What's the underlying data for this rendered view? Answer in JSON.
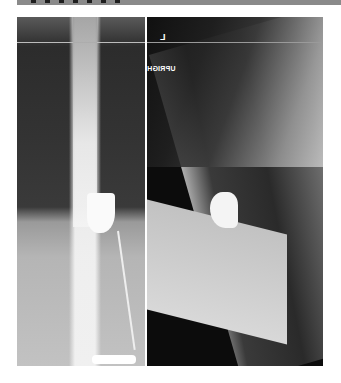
{
  "figure": {
    "panels": [
      {
        "id": "frontal",
        "view": "AP/frontal"
      },
      {
        "id": "lateral",
        "view": "lateral",
        "markers": {
          "side_label": "L",
          "position_label": "UPRIGH"
        }
      }
    ]
  }
}
